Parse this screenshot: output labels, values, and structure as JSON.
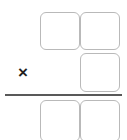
{
  "worksheet": {
    "type": "vertical-multiplication-problem",
    "operator": {
      "symbol": "×",
      "name": "multiplication-sign"
    },
    "rows": [
      {
        "name": "first-operand-row",
        "cells": [
          {
            "name": "digit-cell-tens",
            "value": ""
          },
          {
            "name": "digit-cell-ones",
            "value": ""
          }
        ]
      },
      {
        "name": "second-operand-row",
        "cells": [
          {
            "name": "digit-cell-ones",
            "value": ""
          }
        ]
      },
      {
        "name": "answer-row",
        "cells": [
          {
            "name": "digit-cell-tens",
            "value": ""
          },
          {
            "name": "digit-cell-ones",
            "value": ""
          }
        ]
      }
    ],
    "rule": {
      "name": "answer-rule",
      "color": "#595959"
    },
    "colors": {
      "cell_border": "#b9b9b9",
      "cell_fill": "#ffffff",
      "operator_text": "#231f20",
      "background": "#ffffff"
    }
  }
}
